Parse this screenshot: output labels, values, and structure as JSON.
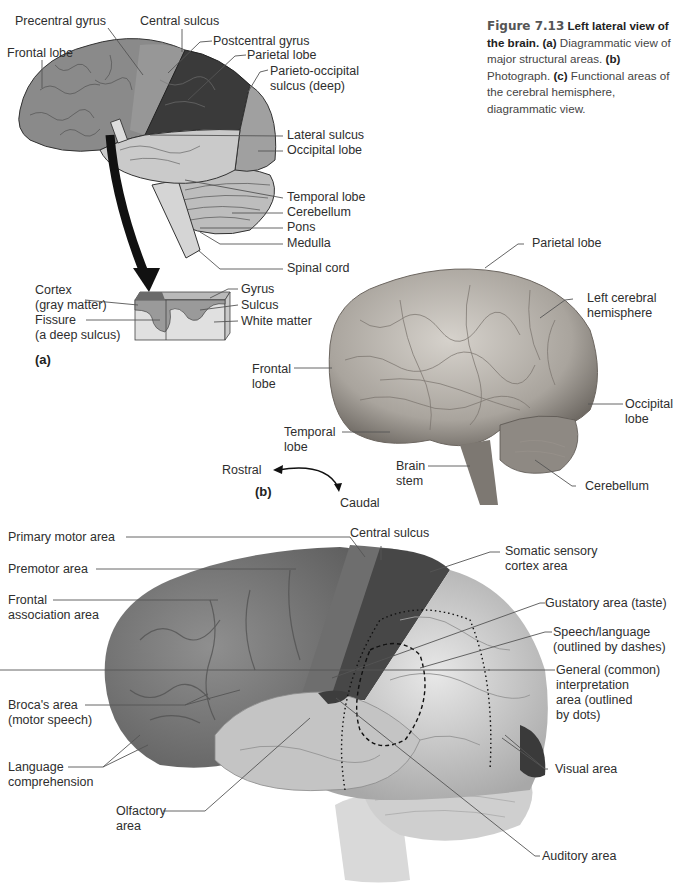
{
  "caption": {
    "figure_number": "Figure 7.13",
    "title": "Left lateral view of the brain.",
    "part_a_marker": "(a)",
    "part_a_text": "Diagrammatic view of major structural areas.",
    "part_b_marker": "(b)",
    "part_b_text": "Photograph.",
    "part_c_marker": "(c)",
    "part_c_text": "Functional areas of the cerebral hemisphere, diagrammatic view."
  },
  "panel_a": {
    "marker": "(a)",
    "labels": {
      "precentral_gyrus": "Precentral gyrus",
      "central_sulcus": "Central sulcus",
      "frontal_lobe": "Frontal lobe",
      "postcentral_gyrus": "Postcentral gyrus",
      "parietal_lobe": "Parietal lobe",
      "parieto_occipital": "Parieto-occipital\nsulcus (deep)",
      "lateral_sulcus": "Lateral sulcus",
      "occipital_lobe": "Occipital lobe",
      "temporal_lobe": "Temporal lobe",
      "cerebellum": "Cerebellum",
      "pons": "Pons",
      "medulla": "Medulla",
      "spinal_cord": "Spinal cord"
    },
    "inset_labels": {
      "cortex": "Cortex\n(gray matter)",
      "fissure": "Fissure\n(a deep sulcus)",
      "gyrus": "Gyrus",
      "sulcus": "Sulcus",
      "white_matter": "White matter"
    }
  },
  "panel_b": {
    "marker": "(b)",
    "labels": {
      "parietal_lobe": "Parietal lobe",
      "left_cerebral_hemisphere": "Left cerebral\nhemisphere",
      "frontal_lobe": "Frontal\nlobe",
      "occipital_lobe": "Occipital\nlobe",
      "temporal_lobe": "Temporal\nlobe",
      "brain_stem": "Brain\nstem",
      "cerebellum": "Cerebellum"
    },
    "orientation": {
      "rostral": "Rostral",
      "caudal": "Caudal"
    }
  },
  "panel_c": {
    "labels": {
      "primary_motor_area": "Primary motor area",
      "central_sulcus": "Central sulcus",
      "premotor_area": "Premotor area",
      "somatic_sensory": "Somatic sensory\ncortex area",
      "frontal_association": "Frontal\nassociation area",
      "gustatory": "Gustatory area (taste)",
      "speech_language": "Speech/language\n(outlined by dashes)",
      "general_interpretation": "General (common)\ninterpretation\narea (outlined\nby dots)",
      "brocas_area": "Broca's area\n(motor speech)",
      "language_comprehension": "Language\ncomprehension",
      "visual_area": "Visual area",
      "olfactory_area": "Olfactory\narea",
      "auditory_area": "Auditory area"
    }
  },
  "colors": {
    "frontal_gray": "#8a8a8a",
    "parietal_dark": "#3a3a3a",
    "temporal_light": "#c9c9c9",
    "occipital_mid": "#a0a0a0",
    "leader_line": "#555555",
    "photo_brain": "#b5b0aa"
  }
}
